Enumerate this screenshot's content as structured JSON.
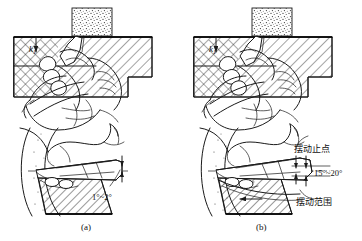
{
  "figure": {
    "title": "",
    "colors": {
      "ink": "#1a1a1a",
      "paper": "#ffffff"
    }
  },
  "panels": [
    {
      "id": "a",
      "caption": "(a)",
      "force_label": "k",
      "force_label_sub": "1",
      "angle_label": "1°~2°",
      "annotations": []
    },
    {
      "id": "b",
      "caption": "(b)",
      "force_label": "k",
      "force_label_sub": "1",
      "angle_label": "15°~20°",
      "annotations": [
        {
          "name": "swing-stop-point",
          "text": "摆动止点"
        },
        {
          "name": "swing-range",
          "text": "摆动范围"
        }
      ]
    }
  ],
  "icons": {
    "arrow": "arrow-icon",
    "hatch": "hatch-pattern-icon",
    "stipple": "stipple-pattern-icon"
  }
}
